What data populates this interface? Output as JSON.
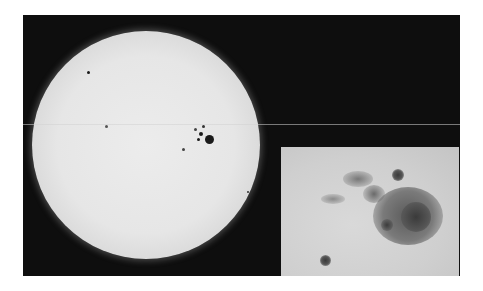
{
  "image": {
    "subject": "Sun with sunspot group and magnified inset",
    "colors": {
      "sky": "#0e0e0e",
      "sun_center": "#ececec",
      "sun_limb": "#b4b4b4",
      "sunspot": "#1a1a1a",
      "inset_bg": "#cfcfcf",
      "inset_umbra": "#4a4a4a",
      "inset_penumbra": "#8a8a8a"
    }
  }
}
